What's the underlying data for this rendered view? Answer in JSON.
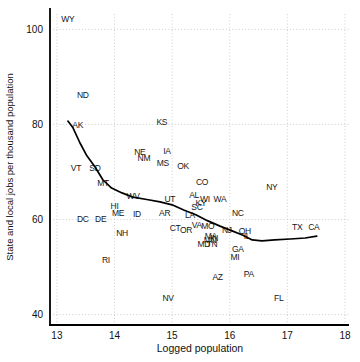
{
  "figure": {
    "background_color": "#ffffff",
    "text_color": "#1a1a1a",
    "axis_color": "#000000",
    "grid_color": "#c9c9c9",
    "trend_color": "#000000"
  },
  "chart_data": {
    "type": "scatter",
    "title": "",
    "xlabel": "Logged population",
    "ylabel": "State and local jobs per thousand population",
    "xlim": [
      12.88,
      18.07
    ],
    "ylim": [
      37.8,
      104.5
    ],
    "x_ticks": [
      13,
      14,
      15,
      16,
      17,
      18
    ],
    "y_ticks": [
      40,
      60,
      80,
      100
    ],
    "grid": "dotted",
    "legend": "none",
    "marker_style": "state-abbreviation-text",
    "points": [
      {
        "label": "WY",
        "x": 13.19,
        "y": 102.2
      },
      {
        "label": "ND",
        "x": 13.45,
        "y": 86.2
      },
      {
        "label": "AK",
        "x": 13.36,
        "y": 79.9
      },
      {
        "label": "KS",
        "x": 14.82,
        "y": 80.5
      },
      {
        "label": "NE",
        "x": 14.44,
        "y": 74.2
      },
      {
        "label": "NM",
        "x": 14.51,
        "y": 72.9
      },
      {
        "label": "IA",
        "x": 14.91,
        "y": 74.4
      },
      {
        "label": "MS",
        "x": 14.84,
        "y": 71.9
      },
      {
        "label": "OK",
        "x": 15.19,
        "y": 71.3
      },
      {
        "label": "VT",
        "x": 13.33,
        "y": 70.8
      },
      {
        "label": "SD",
        "x": 13.66,
        "y": 70.8
      },
      {
        "label": "MT",
        "x": 13.8,
        "y": 67.7
      },
      {
        "label": "WV",
        "x": 14.32,
        "y": 64.9
      },
      {
        "label": "CO",
        "x": 15.52,
        "y": 67.9
      },
      {
        "label": "NY",
        "x": 16.73,
        "y": 66.8
      },
      {
        "label": "UT",
        "x": 14.96,
        "y": 64.3
      },
      {
        "label": "AL",
        "x": 15.38,
        "y": 65.2
      },
      {
        "label": "WI",
        "x": 15.57,
        "y": 64.3
      },
      {
        "label": "KY",
        "x": 15.5,
        "y": 63.5
      },
      {
        "label": "WA",
        "x": 15.83,
        "y": 64.3
      },
      {
        "label": "SC",
        "x": 15.43,
        "y": 62.6
      },
      {
        "label": "HI",
        "x": 14.0,
        "y": 62.8
      },
      {
        "label": "ME",
        "x": 14.06,
        "y": 61.4
      },
      {
        "label": "ID",
        "x": 14.39,
        "y": 61.2
      },
      {
        "label": "AR",
        "x": 14.87,
        "y": 61.4
      },
      {
        "label": "LA",
        "x": 15.31,
        "y": 60.9
      },
      {
        "label": "NC",
        "x": 16.14,
        "y": 61.4
      },
      {
        "label": "DC",
        "x": 13.45,
        "y": 60.1
      },
      {
        "label": "DE",
        "x": 13.76,
        "y": 60.1
      },
      {
        "label": "VA",
        "x": 15.43,
        "y": 58.8
      },
      {
        "label": "MO",
        "x": 15.62,
        "y": 58.6
      },
      {
        "label": "CT",
        "x": 15.05,
        "y": 58.2
      },
      {
        "label": "OR",
        "x": 15.24,
        "y": 57.8
      },
      {
        "label": "NJ",
        "x": 15.95,
        "y": 57.8
      },
      {
        "label": "OH",
        "x": 16.26,
        "y": 57.6
      },
      {
        "label": "IL",
        "x": 16.3,
        "y": 56.5
      },
      {
        "label": "NH",
        "x": 14.13,
        "y": 57.2
      },
      {
        "label": "MA",
        "x": 15.67,
        "y": 56.5
      },
      {
        "label": "IN",
        "x": 15.73,
        "y": 56.1
      },
      {
        "label": "MN",
        "x": 15.66,
        "y": 55.7
      },
      {
        "label": "MD",
        "x": 15.55,
        "y": 54.8
      },
      {
        "label": "TN",
        "x": 15.69,
        "y": 54.8
      },
      {
        "label": "TX",
        "x": 17.17,
        "y": 58.4
      },
      {
        "label": "CA",
        "x": 17.46,
        "y": 58.4
      },
      {
        "label": "GA",
        "x": 16.14,
        "y": 53.8
      },
      {
        "label": "MI",
        "x": 16.09,
        "y": 52.1
      },
      {
        "label": "RI",
        "x": 13.85,
        "y": 51.5
      },
      {
        "label": "AZ",
        "x": 15.79,
        "y": 47.9
      },
      {
        "label": "PA",
        "x": 16.33,
        "y": 48.5
      },
      {
        "label": "FL",
        "x": 16.85,
        "y": 43.5
      },
      {
        "label": "NV",
        "x": 14.93,
        "y": 43.5
      }
    ],
    "trend_line": {
      "name": "fitted-curve",
      "points": [
        [
          13.19,
          80.7
        ],
        [
          13.28,
          79.3
        ],
        [
          13.4,
          76.1
        ],
        [
          13.52,
          73.4
        ],
        [
          13.66,
          71.1
        ],
        [
          13.8,
          68.3
        ],
        [
          13.95,
          66.6
        ],
        [
          14.13,
          65.6
        ],
        [
          14.32,
          64.7
        ],
        [
          14.56,
          64.2
        ],
        [
          14.79,
          63.7
        ],
        [
          15.0,
          63.1
        ],
        [
          15.2,
          62.0
        ],
        [
          15.41,
          61.0
        ],
        [
          15.62,
          59.7
        ],
        [
          15.83,
          58.6
        ],
        [
          16.04,
          57.6
        ],
        [
          16.23,
          56.7
        ],
        [
          16.39,
          55.7
        ],
        [
          16.56,
          55.5
        ],
        [
          16.78,
          55.7
        ],
        [
          17.05,
          55.9
        ],
        [
          17.31,
          56.1
        ],
        [
          17.51,
          56.5
        ]
      ]
    }
  }
}
